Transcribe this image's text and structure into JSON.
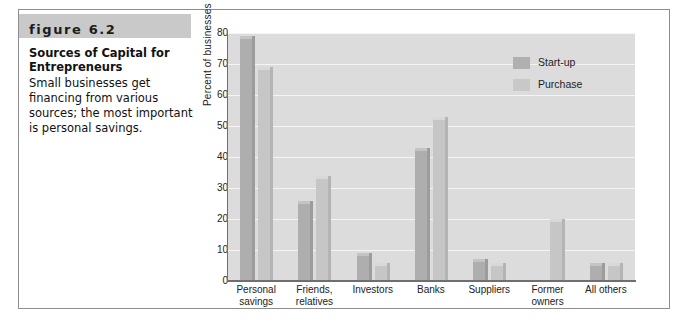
{
  "figure": {
    "band_label": "figure 6.2",
    "title_line1": "Sources of Capital for",
    "title_line2": "Entrepreneurs",
    "body": "Small businesses get financing from various sources; the most important is personal savings."
  },
  "colors": {
    "band": "#c9c9c9",
    "plot_background": "#dcdcdc",
    "gridline": "#f4f4f4",
    "startup_bar": "#aeaeae",
    "purchase_bar": "#c6c6c6",
    "axis": "#6f6f6f",
    "frame": "#8d8d8d"
  },
  "chart_data": {
    "type": "bar",
    "title": "",
    "xlabel": "",
    "ylabel": "Percent of businesses",
    "ylim": [
      0,
      80
    ],
    "yticks": [
      0,
      10,
      20,
      30,
      40,
      50,
      60,
      70,
      80
    ],
    "grid": true,
    "legend_position": "top-right-inside",
    "categories": [
      "Personal savings",
      "Friends, relatives",
      "Investors",
      "Banks",
      "Suppliers",
      "Former owners",
      "All others"
    ],
    "category_lines": [
      [
        "Personal",
        "savings"
      ],
      [
        "Friends,",
        "relatives"
      ],
      [
        "Investors",
        ""
      ],
      [
        "Banks",
        ""
      ],
      [
        "Suppliers",
        ""
      ],
      [
        "Former",
        "owners"
      ],
      [
        "All others",
        ""
      ]
    ],
    "series": [
      {
        "name": "Start-up",
        "values": [
          78,
          25,
          8,
          42,
          6,
          0,
          5
        ]
      },
      {
        "name": "Purchase",
        "values": [
          68,
          33,
          5,
          52,
          5,
          19,
          5
        ]
      }
    ]
  }
}
